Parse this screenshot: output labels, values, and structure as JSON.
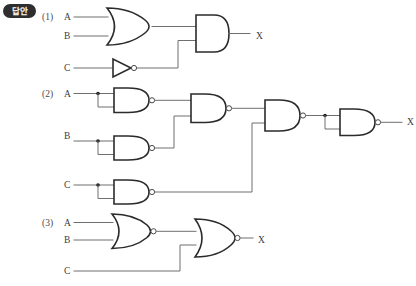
{
  "badge": {
    "label": "답안",
    "name": "answer-badge",
    "bg_color": "#2e2e2e",
    "text_color": "#ffffff"
  },
  "page": {
    "background": "#ffffff",
    "wire_color": "#6f6f6f",
    "gate_stroke": "#2b2b2b",
    "width": 416,
    "height": 286
  },
  "circuits": [
    {
      "number": "(1)",
      "inputs": [
        "A",
        "B",
        "C"
      ],
      "output": "X",
      "gates": [
        "OR",
        "NOT",
        "AND"
      ],
      "description": "A OR B into AND with NOT C"
    },
    {
      "number": "(2)",
      "inputs": [
        "A",
        "B",
        "C"
      ],
      "output": "X",
      "gates": [
        "NAND",
        "NAND",
        "NAND",
        "NAND",
        "NAND",
        "NAND"
      ],
      "description": "NAND inverters on A, B, C feeding NAND tree ending in NAND inverter"
    },
    {
      "number": "(3)",
      "inputs": [
        "A",
        "B",
        "C"
      ],
      "output": "X",
      "gates": [
        "NOR",
        "NOR"
      ],
      "description": "A NOR B into NOR with C"
    }
  ],
  "labels": {
    "c1_num": "(1)",
    "c1_a": "A",
    "c1_b": "B",
    "c1_c": "C",
    "c1_x": "X",
    "c2_num": "(2)",
    "c2_a": "A",
    "c2_b": "B",
    "c2_c": "C",
    "c2_x": "X",
    "c3_num": "(3)",
    "c3_a": "A",
    "c3_b": "B",
    "c3_c": "C",
    "c3_x": "X"
  }
}
